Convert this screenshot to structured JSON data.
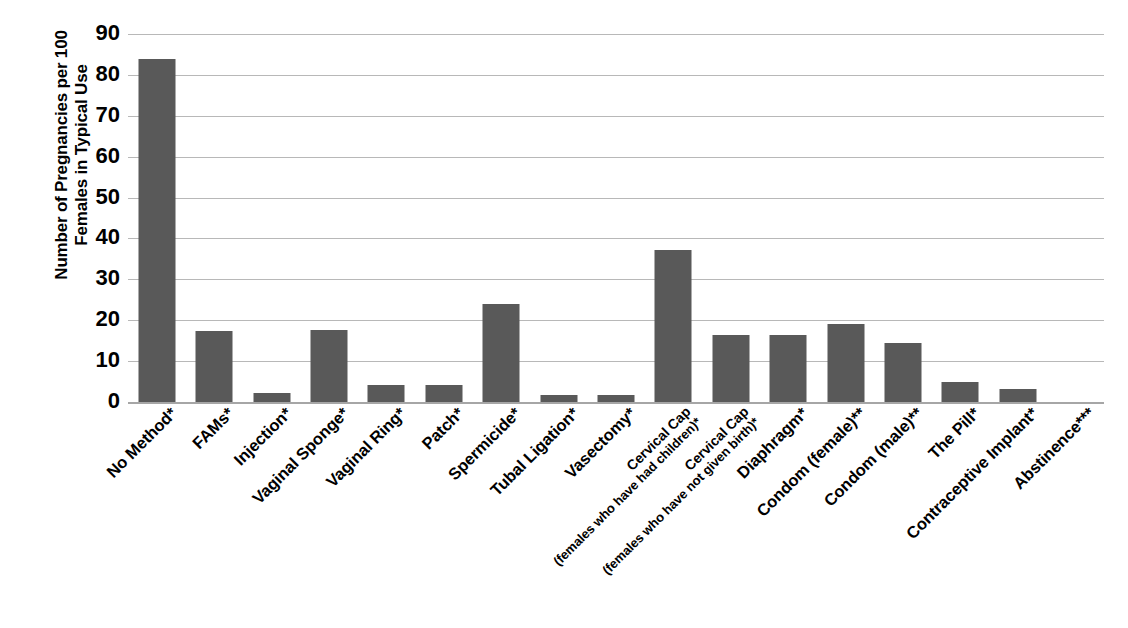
{
  "chart_data": {
    "type": "bar",
    "title": "",
    "xlabel": "",
    "ylabel": "Number of Pregnancies per 100 Females in Typical Use",
    "ylabel_line1": "Number of Pregnancies per 100",
    "ylabel_line2": "Females in Typical Use",
    "ylim": [
      0,
      90
    ],
    "ytick_values": [
      0,
      10,
      20,
      30,
      40,
      50,
      60,
      70,
      80,
      90
    ],
    "ytick_labels": [
      "0",
      "10",
      "20",
      "30",
      "40",
      "50",
      "60",
      "70",
      "80",
      "90"
    ],
    "grid": true,
    "legend": "none",
    "bar_color": "#595959",
    "gridline_color": "#b8b8b8",
    "categories": [
      "No Method*",
      "FAMs*",
      "Injection*",
      "Vaginal Sponge*",
      "Vaginal Ring*",
      "Patch*",
      "Spermicide*",
      "Tubal Ligation*",
      "Vasectomy*",
      "Cervical Cap (females who have had children)*",
      "Cervical Cap (females who have not given birth)*",
      "Diaphragm*",
      "Condom (female)**",
      "Condom (male)**",
      "The Pill*",
      "Contraceptive Implant*",
      "Abstinence***"
    ],
    "category_lines": [
      [
        "No Method*"
      ],
      [
        "FAMs*"
      ],
      [
        "Injection*"
      ],
      [
        "Vaginal Sponge*"
      ],
      [
        "Vaginal Ring*"
      ],
      [
        "Patch*"
      ],
      [
        "Spermicide*"
      ],
      [
        "Tubal Ligation*"
      ],
      [
        "Vasectomy*"
      ],
      [
        "Cervical Cap",
        "(females who have had children)*"
      ],
      [
        "Cervical Cap",
        "(females who have not given birth)*"
      ],
      [
        "Diaphragm*"
      ],
      [
        "Condom (female)**"
      ],
      [
        "Condom (male)**"
      ],
      [
        "The Pill*"
      ],
      [
        "Contraceptive Implant*"
      ],
      [
        "Abstinence***"
      ]
    ],
    "values": [
      84,
      17.4,
      2.2,
      17.5,
      4.2,
      4.2,
      24,
      1.8,
      1.8,
      37.2,
      16.4,
      16.5,
      19,
      14.5,
      4.8,
      3.2,
      0
    ]
  }
}
